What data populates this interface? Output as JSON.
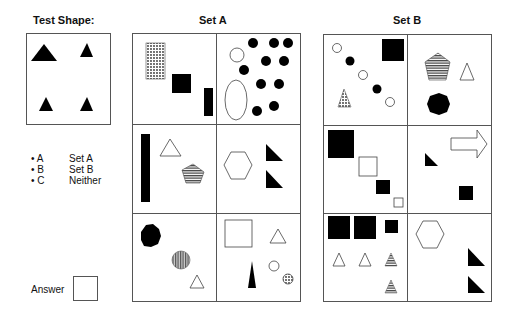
{
  "test": {
    "title": "Test Shape:",
    "shapes": [
      "black-triangle-large",
      "black-triangle-small",
      "black-triangle-small",
      "black-triangle-small"
    ]
  },
  "legend": [
    {
      "key": "• A",
      "label": "Set A"
    },
    {
      "key": "• B",
      "label": "Set B"
    },
    {
      "key": "• C",
      "label": "Neither"
    }
  ],
  "answer": {
    "label": "Answer",
    "value": ""
  },
  "set_a": {
    "title": "Set A",
    "cells": [
      "dotted rectangle, black square, black bar",
      "white circle, white ellipse, 10 black dots",
      "black tall bar, white triangle, striped pentagon",
      "white hexagon, two black right triangles",
      "black octagon, striped circle, white triangle",
      "white square, white triangle, black spike, white circle, dotted circle"
    ]
  },
  "set_b": {
    "title": "Set B",
    "cells": [
      "white circles and black dots diagonal, black square, dotted triangle",
      "striped pentagon, white triangle, black octagon",
      "black square, white square, black square, white square descending",
      "white arrow, black right triangle, black square",
      "three black squares, two white triangles, two striped triangles",
      "white hexagon, two black right triangles"
    ]
  }
}
